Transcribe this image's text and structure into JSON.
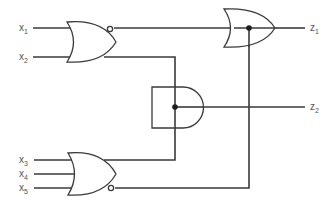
{
  "diagram": {
    "type": "logic-circuit",
    "inputs": [
      {
        "id": "x1",
        "label": "x",
        "sub": "1"
      },
      {
        "id": "x2",
        "label": "x",
        "sub": "2"
      },
      {
        "id": "x3",
        "label": "x",
        "sub": "3"
      },
      {
        "id": "x4",
        "label": "x",
        "sub": "4"
      },
      {
        "id": "x5",
        "label": "x",
        "sub": "5"
      }
    ],
    "outputs": [
      {
        "id": "z1",
        "label": "z",
        "sub": "1"
      },
      {
        "id": "z2",
        "label": "z",
        "sub": "2"
      }
    ],
    "gates": [
      {
        "id": "g1",
        "type": "NOR",
        "inputs": [
          "x1",
          "x2"
        ]
      },
      {
        "id": "g2",
        "type": "NOR",
        "inputs": [
          "x3",
          "x4",
          "x5"
        ]
      },
      {
        "id": "g3",
        "type": "AND",
        "inputs": [
          "x2",
          "x3"
        ]
      },
      {
        "id": "g4",
        "type": "OR",
        "inputs": [
          "g1",
          "g2"
        ]
      }
    ],
    "colors": {
      "line": "#3a3a3a",
      "label": "#555555",
      "background": "#ffffff"
    }
  }
}
